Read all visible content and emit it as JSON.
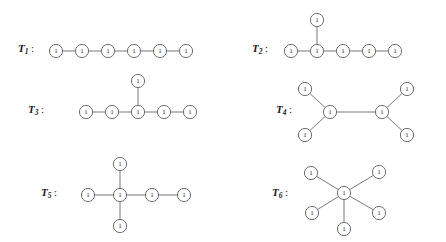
{
  "figure": {
    "title": "",
    "background_color": "#ffffff",
    "line_color": "#6a6a6a",
    "node_fill": "#ffffff",
    "node_stroke": "#5f5f5f",
    "node_radius": 6.6,
    "node_label": "1",
    "label_separator": ":",
    "width": 446,
    "height": 242
  },
  "trees": [
    {
      "id": "T1",
      "name": "T",
      "subscript": "1",
      "label_x": 18,
      "label_y": 52,
      "description": "path with six vertices",
      "nodes": [
        {
          "id": "a",
          "x": 56,
          "y": 51
        },
        {
          "id": "b",
          "x": 82,
          "y": 51
        },
        {
          "id": "c",
          "x": 108,
          "y": 51
        },
        {
          "id": "d",
          "x": 134,
          "y": 51
        },
        {
          "id": "e",
          "x": 160,
          "y": 51
        },
        {
          "id": "f",
          "x": 186,
          "y": 51
        }
      ],
      "edges": [
        [
          "a",
          "b"
        ],
        [
          "b",
          "c"
        ],
        [
          "c",
          "d"
        ],
        [
          "d",
          "e"
        ],
        [
          "e",
          "f"
        ]
      ]
    },
    {
      "id": "T2",
      "name": "T",
      "subscript": "2",
      "label_x": 252,
      "label_y": 52,
      "description": "path with five vertices plus a pendant vertex on the second vertex",
      "nodes": [
        {
          "id": "a",
          "x": 291,
          "y": 51
        },
        {
          "id": "b",
          "x": 317,
          "y": 51
        },
        {
          "id": "c",
          "x": 343,
          "y": 51
        },
        {
          "id": "d",
          "x": 369,
          "y": 51
        },
        {
          "id": "e",
          "x": 395,
          "y": 51
        },
        {
          "id": "p",
          "x": 317,
          "y": 20
        }
      ],
      "edges": [
        [
          "a",
          "b"
        ],
        [
          "b",
          "c"
        ],
        [
          "c",
          "d"
        ],
        [
          "d",
          "e"
        ],
        [
          "b",
          "p"
        ]
      ]
    },
    {
      "id": "T3",
      "name": "T",
      "subscript": "3",
      "label_x": 28,
      "label_y": 113,
      "description": "path with five vertices plus a pendant vertex on the middle vertex",
      "nodes": [
        {
          "id": "a",
          "x": 86,
          "y": 112
        },
        {
          "id": "b",
          "x": 112,
          "y": 112
        },
        {
          "id": "c",
          "x": 138,
          "y": 112
        },
        {
          "id": "d",
          "x": 164,
          "y": 112
        },
        {
          "id": "e",
          "x": 190,
          "y": 112
        },
        {
          "id": "p",
          "x": 138,
          "y": 81
        }
      ],
      "edges": [
        [
          "a",
          "b"
        ],
        [
          "b",
          "c"
        ],
        [
          "c",
          "d"
        ],
        [
          "d",
          "e"
        ],
        [
          "c",
          "p"
        ]
      ]
    },
    {
      "id": "T4",
      "name": "T",
      "subscript": "4",
      "label_x": 276,
      "label_y": 113,
      "description": "two adjacent centres, each with two pendant vertices",
      "nodes": [
        {
          "id": "c1",
          "x": 330,
          "y": 112
        },
        {
          "id": "c2",
          "x": 382,
          "y": 112
        },
        {
          "id": "l1",
          "x": 305,
          "y": 89
        },
        {
          "id": "l2",
          "x": 305,
          "y": 135
        },
        {
          "id": "r1",
          "x": 407,
          "y": 89
        },
        {
          "id": "r2",
          "x": 407,
          "y": 135
        }
      ],
      "edges": [
        [
          "c1",
          "c2"
        ],
        [
          "c1",
          "l1"
        ],
        [
          "c1",
          "l2"
        ],
        [
          "c2",
          "r1"
        ],
        [
          "c2",
          "r2"
        ]
      ]
    },
    {
      "id": "T5",
      "name": "T",
      "subscript": "5",
      "label_x": 41,
      "label_y": 196,
      "description": "centre with three pendant vertices and a path of length two",
      "nodes": [
        {
          "id": "c",
          "x": 120,
          "y": 195
        },
        {
          "id": "w",
          "x": 88,
          "y": 195
        },
        {
          "id": "n",
          "x": 120,
          "y": 164
        },
        {
          "id": "s",
          "x": 120,
          "y": 226
        },
        {
          "id": "e1",
          "x": 152,
          "y": 195
        },
        {
          "id": "e2",
          "x": 184,
          "y": 195
        }
      ],
      "edges": [
        [
          "c",
          "w"
        ],
        [
          "c",
          "n"
        ],
        [
          "c",
          "s"
        ],
        [
          "c",
          "e1"
        ],
        [
          "e1",
          "e2"
        ]
      ]
    },
    {
      "id": "T6",
      "name": "T",
      "subscript": "6",
      "label_x": 272,
      "label_y": 196,
      "description": "star with a centre and five pendant vertices",
      "nodes": [
        {
          "id": "c",
          "x": 344,
          "y": 193
        },
        {
          "id": "ul",
          "x": 311,
          "y": 173
        },
        {
          "id": "ur",
          "x": 379,
          "y": 172
        },
        {
          "id": "ll",
          "x": 312,
          "y": 213
        },
        {
          "id": "lr",
          "x": 379,
          "y": 213
        },
        {
          "id": "b",
          "x": 344,
          "y": 229
        }
      ],
      "edges": [
        [
          "c",
          "ul"
        ],
        [
          "c",
          "ur"
        ],
        [
          "c",
          "ll"
        ],
        [
          "c",
          "lr"
        ],
        [
          "c",
          "b"
        ]
      ]
    }
  ]
}
